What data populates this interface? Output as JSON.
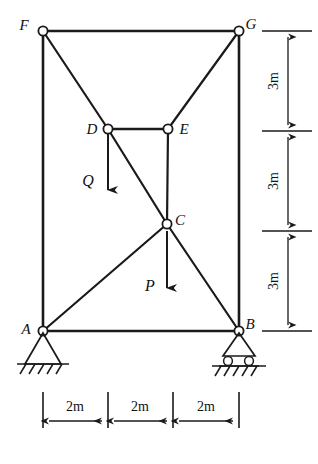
{
  "figure": {
    "stroke_color": "#1a1a1a",
    "background_color": "#ffffff"
  },
  "joints": [
    {
      "id": "F",
      "label": "F",
      "x": 43,
      "y": 31,
      "label_x": 24,
      "label_y": 30
    },
    {
      "id": "G",
      "label": "G",
      "x": 239,
      "y": 31,
      "label_x": 248,
      "label_y": 30
    },
    {
      "id": "D",
      "label": "D",
      "x": 108,
      "y": 129,
      "label_x": 86,
      "label_y": 130
    },
    {
      "id": "E",
      "label": "E",
      "x": 168,
      "y": 129,
      "label_x": 178,
      "label_y": 130
    },
    {
      "id": "C",
      "label": "C",
      "x": 167,
      "y": 224,
      "label_x": 176,
      "label_y": 224
    },
    {
      "id": "A",
      "label": "A",
      "x": 43,
      "y": 331,
      "label_x": 22,
      "label_y": 331
    },
    {
      "id": "B",
      "label": "B",
      "x": 239,
      "y": 331,
      "label_x": 248,
      "label_y": 328
    }
  ],
  "members": [
    {
      "from": "F",
      "to": "G",
      "kind": "chord"
    },
    {
      "from": "F",
      "to": "A",
      "kind": "chord"
    },
    {
      "from": "G",
      "to": "B",
      "kind": "chord"
    },
    {
      "from": "A",
      "to": "B",
      "kind": "chord"
    },
    {
      "from": "D",
      "to": "E",
      "kind": "chord"
    },
    {
      "from": "F",
      "to": "D",
      "kind": "diagonal"
    },
    {
      "from": "G",
      "to": "E",
      "kind": "diagonal"
    },
    {
      "from": "D",
      "to": "C",
      "kind": "diagonal"
    },
    {
      "from": "E",
      "to": "C",
      "kind": "vertical"
    },
    {
      "from": "A",
      "to": "C",
      "kind": "diagonal"
    },
    {
      "from": "C",
      "to": "B",
      "kind": "diagonal"
    }
  ],
  "forces": [
    {
      "id": "Q",
      "label": "Q",
      "applied_at": "D",
      "direction": "down",
      "x": 108,
      "y_start": 134,
      "y_end": 198,
      "label_x": 84,
      "label_y": 182
    },
    {
      "id": "P",
      "label": "P",
      "applied_at": "C",
      "direction": "down",
      "x": 167,
      "y_start": 229,
      "y_end": 296,
      "label_x": 146,
      "label_y": 287
    }
  ],
  "supports": [
    {
      "at": "A",
      "type": "pin",
      "name": "pin-support-a"
    },
    {
      "at": "B",
      "type": "roller",
      "name": "roller-support-b"
    }
  ],
  "dimensions": {
    "vertical": {
      "unit_label": "3m",
      "segments": [
        {
          "label": "3m",
          "y_top": 31,
          "y_bottom": 131
        },
        {
          "label": "3m",
          "y_top": 131,
          "y_bottom": 231
        },
        {
          "label": "3m",
          "y_top": 231,
          "y_bottom": 331
        }
      ],
      "line_x": 288,
      "ext_x_start": 262,
      "ext_x_end": 312
    },
    "horizontal": {
      "unit_label": "2m",
      "segments": [
        {
          "label": "2m",
          "x_left": 43,
          "x_right": 108
        },
        {
          "label": "2m",
          "x_left": 108,
          "x_right": 173
        },
        {
          "label": "2m",
          "x_left": 173,
          "x_right": 239
        }
      ],
      "line_y": 421,
      "ext_y_top": 390,
      "ext_y_bottom": 428
    }
  }
}
